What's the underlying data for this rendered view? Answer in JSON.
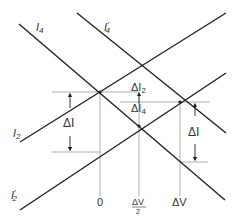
{
  "diagram": {
    "lines": {
      "i4": {
        "label": "I",
        "sub": "4"
      },
      "i4p": {
        "label": "I",
        "sub": "4",
        "prime": "′"
      },
      "i2": {
        "label": "I",
        "sub": "2"
      },
      "i2p": {
        "label": "I",
        "sub": "2",
        "prime": "′"
      }
    },
    "annotations": {
      "delta_i_left": "ΔI",
      "delta_i_right": "ΔI",
      "delta_i2": "ΔI",
      "delta_i2_sub": "2",
      "delta_i4": "ΔI",
      "delta_i4_sub": "4"
    },
    "axis": {
      "zero": "0",
      "half_dv_num": "ΔV",
      "half_dv_den": "2",
      "dv": "ΔV"
    },
    "colors": {
      "line": "#222222",
      "guide": "#999999",
      "text": "#333333"
    }
  }
}
